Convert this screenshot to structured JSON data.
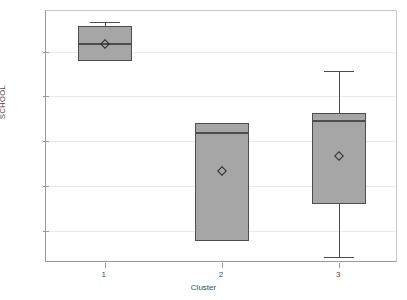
{
  "chart_data": {
    "type": "box",
    "title": "",
    "xlabel": "Cluster",
    "ylabel": "SCHOOL",
    "categories": [
      "1",
      "2",
      "3"
    ],
    "ytick_labels": [
      "9",
      "10",
      "11",
      "12",
      "13"
    ],
    "ytick_values": [
      9,
      10,
      11,
      12,
      13
    ],
    "ylim": [
      8.28,
      13.91
    ],
    "grid": true,
    "legend": false,
    "marker_legend": "diamond = mean",
    "boxes": [
      {
        "category": "1",
        "whisker_low": 12.8,
        "q1": 12.8,
        "median": 13.18,
        "q3": 13.58,
        "whisker_high": 13.67,
        "mean": 13.18
      },
      {
        "category": "2",
        "whisker_low": 8.77,
        "q1": 8.77,
        "median": 11.18,
        "q3": 11.4,
        "whisker_high": 11.4,
        "mean": 10.33
      },
      {
        "category": "3",
        "whisker_low": 8.42,
        "q1": 9.6,
        "median": 11.45,
        "q3": 11.63,
        "whisker_high": 12.57,
        "mean": 10.66
      }
    ],
    "colors": {
      "box_fill": "#a6a6a6",
      "box_edge": "#4d4d4d",
      "grid": "#e9e9e9",
      "axis": "#9a9a9a",
      "text": "#4a4a4a",
      "background": "#ffffff"
    }
  }
}
